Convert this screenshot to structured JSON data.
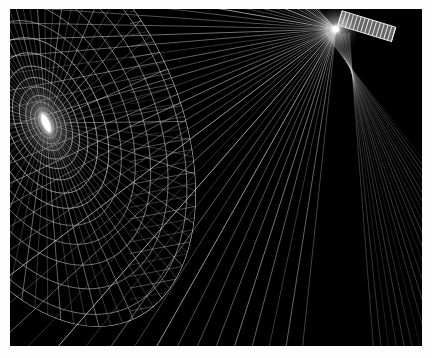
{
  "figure": {
    "background_color": "#000000",
    "page_background_color": "#fdfdfd",
    "frame": {
      "x": 10,
      "y": 9,
      "width": 412,
      "height": 337
    },
    "line_color": "#d8d8d8",
    "line_color_dim": "#6e6e6e",
    "line_color_bright": "#ffffff",
    "glow_color": "#ffffff"
  },
  "chart_data": {
    "type": "scatter",
    "xlabel": "",
    "ylabel": "",
    "grid": false,
    "legend": "none",
    "left_field": {
      "name": "polar-grid",
      "center_x": 36,
      "center_y": 114,
      "ellipse_ratio_x": 0.62,
      "ellipse_ratio_y": 1.0,
      "rotation_deg": -24,
      "radial_spokes": 72,
      "concentric_rings": 26,
      "ring_radii": [
        7,
        11,
        16,
        22,
        29,
        38,
        48,
        60,
        74,
        90,
        108,
        128,
        150,
        175,
        202,
        232,
        265,
        300,
        338,
        379,
        423,
        470,
        520,
        573,
        629,
        688
      ],
      "boundary_arc_radius": 215,
      "glow_core": {
        "x": 36,
        "y": 114,
        "rx": 9,
        "ry": 22,
        "rotation_deg": -24
      }
    },
    "right_field": {
      "name": "ray-fan",
      "source_x": 336,
      "source_y": 29,
      "ray_count": 46,
      "ray_angle_min_deg": 96,
      "ray_angle_max_deg": 228,
      "shallow_line_count": 40,
      "shallow_line_slope_deg": 11,
      "comb_element": {
        "x": 340,
        "y": 18,
        "length": 56,
        "width": 15,
        "rotation_deg": 17,
        "teeth": 14
      }
    }
  }
}
